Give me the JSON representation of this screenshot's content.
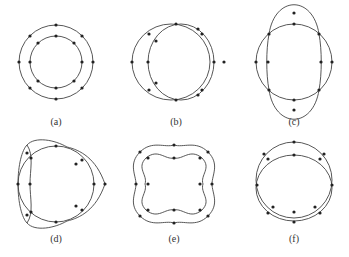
{
  "figure": {
    "panels": [
      {
        "label": "(a)",
        "description": "Two concentric circles, each with 8 nodes"
      },
      {
        "label": "(b)",
        "description": "Two circles shifted horizontally, touching at top and bottom"
      },
      {
        "label": "(c)",
        "description": "Circle overlaid with vertically elongated mode shape (2 lobes)"
      },
      {
        "label": "(d)",
        "description": "Circle overlaid with 3-lobed mode shape"
      },
      {
        "label": "(e)",
        "description": "Two 4-lobed mode shapes out of phase"
      },
      {
        "label": "(f)",
        "description": "Two circles shifted vertically, touching at left and right"
      }
    ]
  },
  "colors": {
    "stroke": "#444444",
    "node": "#222222",
    "background": "#ffffff"
  }
}
